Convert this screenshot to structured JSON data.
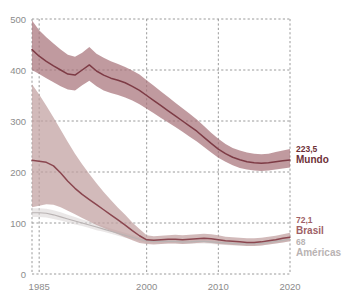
{
  "chart_data": {
    "type": "line",
    "title": "",
    "subtitle": "",
    "xlabel": "",
    "ylabel": "",
    "xlim": [
      1984,
      2020
    ],
    "ylim": [
      0,
      500
    ],
    "grid": true,
    "legend_position": "right-inline-annotations",
    "x_ticks": [
      "1985",
      "2000",
      "2010",
      "2020"
    ],
    "x_tick_values": [
      1985,
      2000,
      2010,
      2020
    ],
    "y_ticks": [
      "0",
      "100",
      "200",
      "300",
      "400",
      "500"
    ],
    "y_tick_values": [
      0,
      100,
      200,
      300,
      400,
      500
    ],
    "x": [
      1984,
      1985,
      1986,
      1987,
      1988,
      1989,
      1990,
      1991,
      1992,
      1993,
      1994,
      1995,
      1996,
      1997,
      1998,
      1999,
      2000,
      2001,
      2002,
      2003,
      2004,
      2005,
      2006,
      2007,
      2008,
      2009,
      2010,
      2011,
      2012,
      2013,
      2014,
      2015,
      2016,
      2017,
      2018,
      2019,
      2020
    ],
    "series": [
      {
        "name": "Mundo",
        "color": "#7d3b45",
        "band_color": "#a8737a",
        "end_label": "223,5",
        "end_value": 223.5,
        "values": [
          440,
          427,
          417,
          408,
          400,
          392,
          390,
          400,
          410,
          398,
          390,
          384,
          380,
          375,
          368,
          360,
          350,
          340,
          330,
          320,
          310,
          300,
          290,
          280,
          268,
          256,
          245,
          236,
          229,
          224,
          220,
          218,
          217,
          218,
          220,
          222,
          223.5
        ],
        "lower": [
          400,
          392,
          384,
          376,
          368,
          362,
          360,
          370,
          379,
          368,
          360,
          355,
          351,
          346,
          340,
          333,
          324,
          315,
          306,
          297,
          288,
          279,
          269,
          260,
          249,
          238,
          228,
          220,
          213,
          208,
          205,
          203,
          202,
          203,
          205,
          207,
          209
        ],
        "upper": [
          497,
          478,
          464,
          452,
          440,
          430,
          426,
          434,
          445,
          432,
          424,
          417,
          412,
          406,
          399,
          391,
          380,
          369,
          358,
          347,
          336,
          325,
          314,
          303,
          290,
          277,
          265,
          255,
          247,
          242,
          238,
          236,
          235,
          236,
          239,
          242,
          245
        ]
      },
      {
        "name": "Brasil",
        "color": "#8a464f",
        "band_color": "#c0a0a0",
        "end_label": "72,1",
        "end_value": 72.1,
        "values": [
          223,
          221,
          219,
          212,
          198,
          182,
          168,
          156,
          146,
          136,
          126,
          116,
          106,
          96,
          85,
          75,
          67,
          66,
          67,
          68,
          68,
          67,
          68,
          69,
          70,
          69,
          67,
          65,
          64,
          63,
          62,
          62,
          63,
          65,
          67,
          70,
          72.1
        ],
        "lower": [
          131,
          134,
          137,
          136,
          131,
          124,
          117,
          110,
          103,
          96,
          90,
          84,
          78,
          72,
          66,
          61,
          59,
          58,
          59,
          60,
          60,
          59,
          60,
          61,
          62,
          61,
          59,
          58,
          57,
          56,
          55,
          55,
          56,
          58,
          60,
          62,
          64
        ],
        "upper": [
          372,
          352,
          330,
          307,
          283,
          259,
          236,
          215,
          196,
          178,
          161,
          145,
          130,
          116,
          101,
          88,
          76,
          74,
          75,
          76,
          77,
          76,
          77,
          78,
          79,
          78,
          76,
          73,
          72,
          71,
          70,
          70,
          71,
          73,
          75,
          78,
          81
        ]
      },
      {
        "name": "Américas",
        "color": "#b9b3b3",
        "band_color": "#d8d4d4",
        "end_label": "68",
        "end_value": 68,
        "values": [
          120,
          120,
          119,
          116,
          112,
          108,
          104,
          100,
          96,
          92,
          88,
          84,
          80,
          76,
          72,
          68,
          65,
          64,
          64,
          64,
          64,
          63,
          63,
          64,
          64,
          63,
          62,
          61,
          60,
          59,
          59,
          59,
          60,
          62,
          64,
          66,
          68
        ],
        "lower": [
          112,
          112,
          111,
          108,
          105,
          101,
          97,
          94,
          90,
          86,
          83,
          79,
          75,
          71,
          68,
          64,
          61,
          60,
          60,
          60,
          60,
          59,
          59,
          60,
          60,
          59,
          58,
          57,
          56,
          56,
          55,
          55,
          56,
          58,
          60,
          62,
          64
        ],
        "upper": [
          129,
          129,
          128,
          125,
          121,
          116,
          112,
          107,
          103,
          98,
          94,
          89,
          85,
          81,
          77,
          72,
          69,
          68,
          68,
          68,
          68,
          67,
          67,
          68,
          68,
          67,
          66,
          65,
          64,
          63,
          62,
          63,
          64,
          66,
          68,
          70,
          72
        ]
      }
    ]
  },
  "annotations": {
    "mundo": {
      "value": "223,5",
      "name": "Mundo"
    },
    "brasil": {
      "value": "72,1",
      "name": "Brasil"
    },
    "americas": {
      "value": "68",
      "name": "Américas"
    }
  },
  "colors": {
    "mundo_line": "#7d3b45",
    "mundo_band": "#a8737a",
    "brasil_line": "#8a464f",
    "brasil_band": "#c0a0a0",
    "americas_line": "#b9b3b3",
    "americas_band": "#d8d4d4",
    "grid": "#9a9a9a",
    "tick_text": "#8c8c8c",
    "background": "#ffffff"
  }
}
